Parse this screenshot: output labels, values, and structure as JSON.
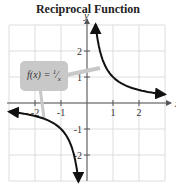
{
  "chart_data": {
    "type": "line",
    "title": "Reciprocal Function",
    "xlabel": "x",
    "ylabel": "y",
    "xlim": [
      -3,
      3
    ],
    "ylim": [
      -3,
      3
    ],
    "grid": true,
    "x_ticks": [
      -2,
      -1,
      1,
      2
    ],
    "y_ticks": [
      2,
      1,
      -1,
      -2
    ],
    "x_tick_labels": [
      "-2",
      "-1",
      "1",
      "2"
    ],
    "y_tick_labels": [
      "2",
      "1",
      "-1",
      "-2"
    ],
    "series": [
      {
        "name": "f(x) = 1/x",
        "function": "1/x",
        "branches": [
          [
            0.33,
            3.0
          ],
          [
            -3.0,
            -0.33
          ]
        ]
      }
    ],
    "annotation": "f(x) = 1/x"
  }
}
